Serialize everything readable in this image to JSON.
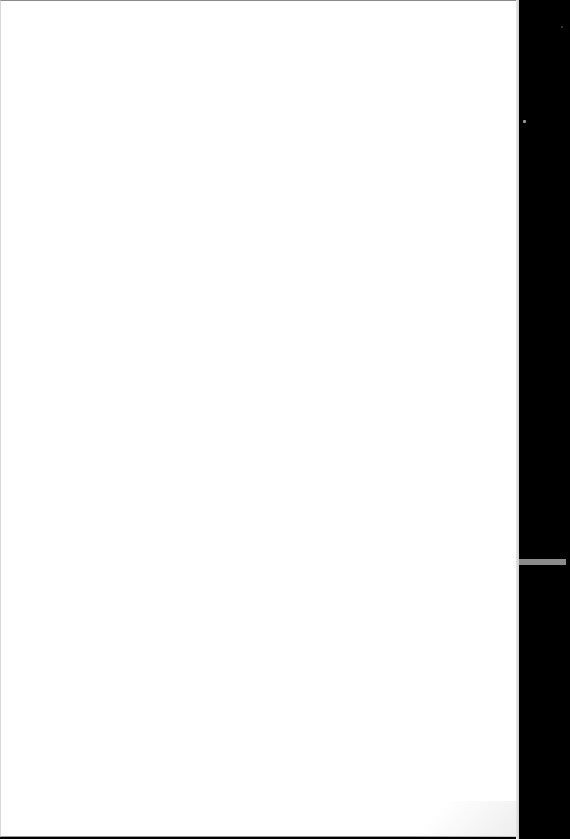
{
  "document": {
    "page_content": "",
    "colors": {
      "paper": "#ffffff",
      "background_margin": "#000000",
      "margin_strip": "#8c8c8c"
    }
  }
}
